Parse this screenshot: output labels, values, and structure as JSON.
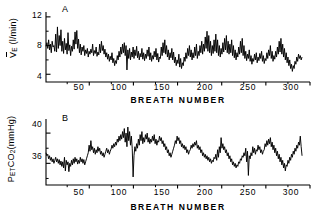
{
  "figure": {
    "background": "#ffffff",
    "ink": "#000000"
  },
  "panels": [
    {
      "id": "A",
      "label": "A",
      "ylabel_main": "V",
      "ylabel_sub": "E",
      "ylabel_units": "(l/min)",
      "yticks": [
        "4",
        "8",
        "12"
      ],
      "xticks": [
        "50",
        "100",
        "150",
        "200",
        "250",
        "300"
      ],
      "xtitle": "BREATH NUMBER"
    },
    {
      "id": "B",
      "label": "B",
      "ylabel_main": "P",
      "ylabel_sub": "ET",
      "ylabel_main2": "CO",
      "ylabel_sub2": "2",
      "ylabel_units": "(mmHg)",
      "yticks": [
        "36",
        "40"
      ],
      "xticks": [
        "50",
        "100",
        "150",
        "200",
        "250",
        "300"
      ],
      "xtitle": "BREATH NUMBER"
    }
  ],
  "chart_data": [
    {
      "type": "line",
      "panel": "A",
      "title": "A",
      "xlabel": "BREATH NUMBER",
      "ylabel": "VE (l/min)",
      "xlim": [
        1,
        300
      ],
      "ylim": [
        3.2,
        12.4
      ],
      "yticks": [
        4,
        8,
        12
      ],
      "xticks": [
        50,
        100,
        150,
        200,
        250,
        300
      ],
      "grid": false,
      "legend": "none",
      "series": [
        {
          "name": "minute ventilation",
          "x_start": 1,
          "x_end": 291,
          "values": [
            7.9,
            8.4,
            7.6,
            8.8,
            7.4,
            8.2,
            7.0,
            8.6,
            7.8,
            8.0,
            7.2,
            9.6,
            7.1,
            10.6,
            7.6,
            9.4,
            8.0,
            10.2,
            7.2,
            8.6,
            6.9,
            9.0,
            7.4,
            8.3,
            6.8,
            9.8,
            7.3,
            8.1,
            6.6,
            7.9,
            7.2,
            8.8,
            7.5,
            9.9,
            8.2,
            10.1,
            7.6,
            8.9,
            7.0,
            8.2,
            6.7,
            7.8,
            7.2,
            8.0,
            6.6,
            7.4,
            6.9,
            7.6,
            6.4,
            7.2,
            6.8,
            7.5,
            7.0,
            8.2,
            6.6,
            7.3,
            6.9,
            7.8,
            6.5,
            7.1,
            6.7,
            8.2,
            7.0,
            8.6,
            7.3,
            8.0,
            6.8,
            7.5,
            6.4,
            7.0,
            6.1,
            6.8,
            5.8,
            6.5,
            6.0,
            7.0,
            5.6,
            6.2,
            5.2,
            5.9,
            5.5,
            6.6,
            6.0,
            7.2,
            6.4,
            7.8,
            6.8,
            8.2,
            7.0,
            8.4,
            6.6,
            8.0,
            4.6,
            7.4,
            6.2,
            7.6,
            6.0,
            7.1,
            6.4,
            7.8,
            6.2,
            7.4,
            6.6,
            7.9,
            6.3,
            7.2,
            6.0,
            6.9,
            6.4,
            7.6,
            6.1,
            7.0,
            5.9,
            6.8,
            6.2,
            7.4,
            6.5,
            7.8,
            6.0,
            7.0,
            5.8,
            6.6,
            6.1,
            7.2,
            6.4,
            7.6,
            6.0,
            6.9,
            5.7,
            6.4,
            6.2,
            7.8,
            6.6,
            8.4,
            7.0,
            8.8,
            6.8,
            8.0,
            6.4,
            7.4,
            6.0,
            7.0,
            6.3,
            7.6,
            6.0,
            7.1,
            5.6,
            6.4,
            5.2,
            6.0,
            5.5,
            6.8,
            5.0,
            6.2,
            4.8,
            5.6,
            5.2,
            6.4,
            5.8,
            7.0,
            6.2,
            7.6,
            6.6,
            8.0,
            6.4,
            7.4,
            6.0,
            7.0,
            6.3,
            7.8,
            6.6,
            8.2,
            6.2,
            7.2,
            6.6,
            8.0,
            7.0,
            8.6,
            6.8,
            8.2,
            7.2,
            9.2,
            7.6,
            10.0,
            7.2,
            9.4,
            7.0,
            8.6,
            6.6,
            8.0,
            6.9,
            8.8,
            7.2,
            9.6,
            7.0,
            8.8,
            6.6,
            8.0,
            6.4,
            7.6,
            6.8,
            8.4,
            7.1,
            9.0,
            7.4,
            9.4,
            7.0,
            8.6,
            6.8,
            8.2,
            7.0,
            8.8,
            6.6,
            8.0,
            6.3,
            7.4,
            6.0,
            7.0,
            6.4,
            7.8,
            6.8,
            8.6,
            7.0,
            9.0,
            6.6,
            8.0,
            6.2,
            7.2,
            5.9,
            6.8,
            6.2,
            7.4,
            5.8,
            6.6,
            5.4,
            6.2,
            5.8,
            6.8,
            6.0,
            7.0,
            5.6,
            6.4,
            5.9,
            6.9,
            6.2,
            7.2,
            5.8,
            6.6,
            5.5,
            6.2,
            5.9,
            7.0,
            6.2,
            7.4,
            6.6,
            8.0,
            6.2,
            7.2,
            5.8,
            6.6,
            6.1,
            7.2,
            6.4,
            7.8,
            6.8,
            8.6,
            7.1,
            9.0,
            6.8,
            8.2,
            6.4,
            7.6,
            6.0,
            7.0,
            5.6,
            6.4,
            5.2,
            6.0,
            4.8,
            5.4,
            4.4,
            5.2,
            4.8,
            5.8,
            5.4,
            6.4,
            5.8,
            6.8,
            6.2,
            6.6,
            6.0,
            6.4
          ]
        }
      ]
    },
    {
      "type": "line",
      "panel": "B",
      "title": "B",
      "xlabel": "BREATH NUMBER",
      "ylabel": "PETCO2 (mmHg)",
      "xlim": [
        1,
        300
      ],
      "ylim": [
        33.4,
        41.6
      ],
      "yticks": [
        36,
        40
      ],
      "xticks": [
        50,
        100,
        150,
        200,
        250,
        300
      ],
      "grid": false,
      "legend": "none",
      "series": [
        {
          "name": "end-tidal CO2",
          "x_start": 1,
          "x_end": 291,
          "values": [
            37.4,
            37.0,
            37.2,
            36.6,
            37.0,
            36.4,
            36.8,
            36.2,
            36.6,
            36.0,
            36.4,
            36.8,
            36.2,
            36.6,
            36.0,
            36.5,
            35.8,
            36.3,
            35.6,
            36.2,
            35.4,
            36.8,
            35.0,
            36.4,
            35.8,
            36.2,
            34.9,
            36.0,
            35.6,
            36.4,
            35.8,
            36.6,
            36.0,
            36.8,
            36.2,
            36.6,
            35.9,
            36.4,
            36.0,
            36.8,
            36.2,
            36.6,
            36.0,
            36.5,
            35.8,
            36.2,
            36.6,
            37.0,
            37.4,
            38.4,
            37.6,
            39.0,
            37.8,
            38.2,
            37.4,
            38.0,
            37.2,
            37.8,
            37.4,
            38.2,
            37.6,
            38.0,
            37.2,
            37.6,
            37.0,
            37.4,
            36.8,
            37.2,
            37.6,
            38.0,
            37.4,
            37.8,
            37.2,
            37.6,
            37.9,
            38.4,
            38.0,
            38.6,
            38.2,
            38.8,
            38.4,
            39.2,
            38.8,
            39.6,
            39.0,
            39.8,
            39.2,
            40.2,
            39.4,
            40.6,
            38.8,
            40.0,
            38.2,
            40.8,
            39.0,
            40.2,
            38.4,
            39.6,
            38.0,
            34.2,
            37.0,
            38.2,
            37.6,
            38.6,
            38.0,
            39.2,
            38.4,
            39.8,
            39.0,
            40.2,
            38.6,
            39.4,
            38.8,
            39.8,
            39.2,
            40.0,
            38.8,
            39.4,
            38.6,
            39.2,
            38.8,
            39.6,
            39.0,
            39.8,
            38.6,
            39.2,
            38.4,
            39.0,
            38.8,
            39.6,
            39.0,
            39.4,
            38.6,
            39.0,
            38.2,
            38.6,
            37.8,
            38.2,
            37.4,
            37.8,
            37.0,
            37.4,
            36.8,
            37.2,
            37.6,
            38.0,
            38.4,
            39.0,
            38.6,
            39.6,
            39.0,
            39.4,
            38.6,
            39.0,
            38.2,
            38.6,
            38.0,
            38.4,
            37.8,
            38.2,
            37.4,
            37.8,
            37.2,
            37.6,
            37.8,
            38.4,
            38.0,
            38.6,
            38.2,
            38.8,
            38.4,
            39.0,
            38.0,
            38.4,
            37.8,
            38.2,
            37.4,
            37.8,
            37.0,
            37.4,
            36.8,
            37.2,
            36.6,
            37.0,
            36.4,
            36.8,
            36.2,
            36.6,
            36.0,
            36.4,
            36.2,
            36.8,
            36.6,
            37.2,
            36.4,
            37.8,
            36.8,
            38.2,
            37.4,
            39.4,
            38.0,
            38.6,
            37.8,
            38.2,
            37.4,
            37.8,
            37.0,
            37.4,
            36.6,
            37.0,
            36.2,
            36.6,
            35.8,
            36.2,
            35.6,
            36.0,
            35.4,
            35.8,
            35.6,
            36.2,
            36.0,
            36.6,
            36.4,
            37.0,
            36.8,
            37.4,
            37.0,
            38.0,
            36.2,
            37.6,
            34.4,
            37.0,
            36.6,
            37.4,
            37.0,
            38.2,
            37.4,
            38.0,
            37.2,
            37.8,
            37.6,
            38.4,
            37.8,
            38.2,
            37.4,
            37.8,
            37.2,
            37.6,
            37.8,
            38.6,
            38.2,
            39.0,
            38.4,
            39.2,
            38.6,
            39.4,
            38.2,
            38.8,
            37.8,
            38.4,
            37.4,
            38.0,
            37.0,
            37.6,
            36.6,
            37.2,
            36.2,
            36.8,
            35.8,
            36.4,
            35.4,
            36.0,
            35.0,
            35.8,
            35.6,
            36.4,
            36.0,
            36.8,
            36.4,
            37.2,
            36.8,
            37.6,
            37.2,
            38.0,
            37.6,
            38.4,
            38.0,
            38.8,
            38.4,
            39.6,
            38.2,
            37.0
          ]
        }
      ]
    }
  ]
}
